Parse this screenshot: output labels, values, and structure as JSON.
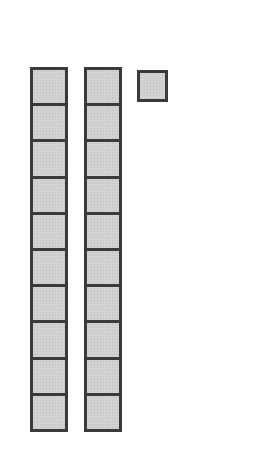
{
  "diagram": {
    "type": "base-ten-blocks",
    "represented_value": 21,
    "rods": [
      {
        "label": "ten-rod-1",
        "cells": 10
      },
      {
        "label": "ten-rod-2",
        "cells": 10
      }
    ],
    "units": [
      {
        "label": "unit-cube-1"
      }
    ],
    "colors": {
      "fill": "#d2d2d2",
      "border": "#3a3a3a"
    }
  }
}
